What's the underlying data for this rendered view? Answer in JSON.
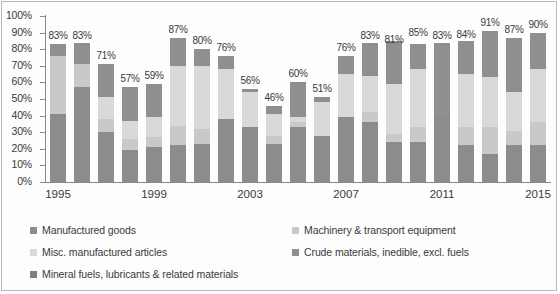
{
  "chart_data": {
    "type": "bar",
    "subtype": "stacked-bar",
    "title": "",
    "xlabel": "",
    "ylabel": "",
    "ylim": [
      0,
      100
    ],
    "yticks": [
      "0%",
      "10%",
      "20%",
      "30%",
      "40%",
      "50%",
      "60%",
      "70%",
      "80%",
      "90%",
      "100%"
    ],
    "ytick_values": [
      0,
      10,
      20,
      30,
      40,
      50,
      60,
      70,
      80,
      90,
      100
    ],
    "grid": false,
    "legend_position": "bottom",
    "categories": [
      "1995",
      "1996",
      "1997",
      "1998",
      "1999",
      "2000",
      "2001",
      "2002",
      "2003",
      "2004",
      "2005",
      "2006",
      "2007",
      "2008",
      "2009",
      "2010",
      "2011",
      "2012",
      "2013",
      "2014",
      "2015"
    ],
    "xtick_labels": [
      "1995",
      "1999",
      "2003",
      "2007",
      "2011",
      "2015"
    ],
    "xtick_indices": [
      0,
      4,
      8,
      12,
      16,
      20
    ],
    "series": [
      {
        "name": "Manufactured goods",
        "color": "#8c8c8c",
        "values": [
          41,
          57,
          30,
          19,
          21,
          22,
          23,
          38,
          33,
          23,
          33,
          28,
          39,
          36,
          24,
          24,
          39,
          22,
          17,
          22,
          22
        ]
      },
      {
        "name": "Machinery & transport equipment",
        "color": "#c9c9c9",
        "values": [
          35,
          14,
          8,
          7,
          6,
          12,
          9,
          0,
          0,
          5,
          3,
          0,
          0,
          6,
          5,
          9,
          0,
          11,
          16,
          9,
          14
        ]
      },
      {
        "name": "Misc. manufactured articles",
        "color": "#d9d9d9",
        "values": [
          0,
          0,
          13,
          11,
          12,
          36,
          38,
          30,
          21,
          13,
          3,
          20,
          26,
          22,
          30,
          35,
          0,
          32,
          30,
          23,
          32
        ]
      },
      {
        "name": "Crude materials, inedible, excl. fuels",
        "color": "#8f8f8f",
        "values": [
          7,
          13,
          20,
          20,
          20,
          17,
          10,
          8,
          2,
          5,
          21,
          3,
          11,
          20,
          26,
          15,
          45,
          20,
          28,
          33,
          22
        ]
      },
      {
        "name": "Mineral fuels, lubricants & related materials",
        "color": "#7f7f7f",
        "values": [
          0,
          0,
          0,
          0,
          0,
          0,
          0,
          0,
          0,
          0,
          0,
          0,
          0,
          0,
          0,
          0,
          0,
          0,
          0,
          0,
          0
        ]
      }
    ],
    "totals": [
      83,
      83,
      71,
      57,
      59,
      87,
      80,
      76,
      56,
      46,
      60,
      51,
      76,
      83,
      81,
      85,
      83,
      84,
      91,
      87,
      90
    ],
    "total_labels": [
      "83%",
      "83%",
      "71%",
      "57%",
      "59%",
      "87%",
      "80%",
      "76%",
      "56%",
      "46%",
      "60%",
      "51%",
      "76%",
      "83%",
      "81%",
      "85%",
      "83%",
      "84%",
      "91%",
      "87%",
      "90%"
    ]
  },
  "legend": {
    "entries": [
      {
        "label": "Manufactured goods",
        "color": "#8c8c8c"
      },
      {
        "label": "Machinery & transport equipment",
        "color": "#c9c9c9"
      },
      {
        "label": "Misc. manufactured articles",
        "color": "#d9d9d9"
      },
      {
        "label": "Crude materials, inedible, excl. fuels",
        "color": "#8f8f8f"
      },
      {
        "label": "Mineral fuels, lubricants & related materials",
        "color": "#7f7f7f"
      }
    ]
  }
}
